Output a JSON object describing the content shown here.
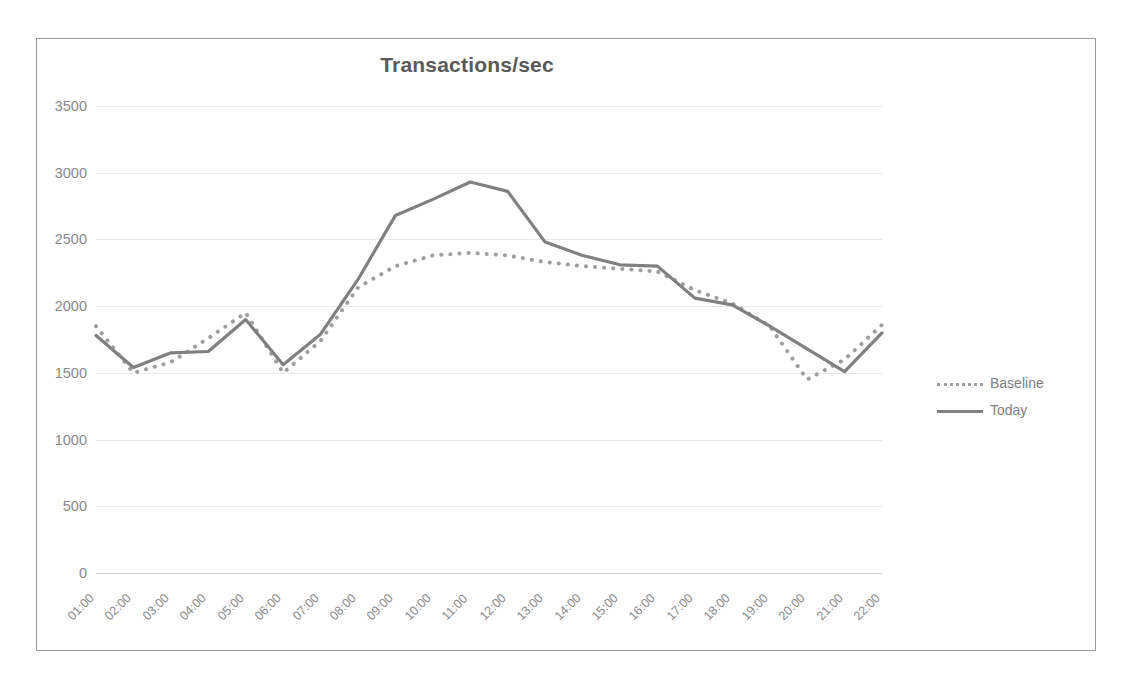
{
  "chart_data": {
    "type": "line",
    "title": "Transactions/sec",
    "xlabel": "",
    "ylabel": "",
    "ylim": [
      0,
      3500
    ],
    "yticks": [
      0,
      500,
      1000,
      1500,
      2000,
      2500,
      3000,
      3500
    ],
    "ytick_labels": [
      "0",
      "500",
      "1000",
      "1500",
      "2000",
      "2500",
      "3000",
      "3500"
    ],
    "grid": true,
    "legend_position": "right",
    "categories": [
      "01:00",
      "02:00",
      "03:00",
      "04:00",
      "05:00",
      "06:00",
      "07:00",
      "08:00",
      "09:00",
      "10:00",
      "11:00",
      "12:00",
      "13:00",
      "14:00",
      "15:00",
      "16:00",
      "17:00",
      "18:00",
      "19:00",
      "20:00",
      "21:00",
      "22:00"
    ],
    "series": [
      {
        "name": "Baseline",
        "style": "dotted",
        "color": "#9e9e9e",
        "values": [
          1850,
          1500,
          1580,
          1760,
          1950,
          1500,
          1740,
          2140,
          2300,
          2380,
          2400,
          2380,
          2330,
          2300,
          2280,
          2260,
          2120,
          2020,
          1850,
          1450,
          1600,
          1860
        ]
      },
      {
        "name": "Today",
        "style": "solid",
        "color": "#808080",
        "values": [
          1780,
          1540,
          1650,
          1660,
          1900,
          1560,
          1790,
          2200,
          2680,
          2800,
          2930,
          2860,
          2480,
          2380,
          2310,
          2300,
          2060,
          2010,
          1850,
          1680,
          1510,
          1800
        ]
      }
    ]
  },
  "legend": {
    "items": [
      {
        "label": "Baseline"
      },
      {
        "label": "Today"
      }
    ]
  },
  "colors": {
    "frame": "#9a9a9a",
    "grid": "#e8e8e8",
    "tick_text": "#8a8a8a",
    "title_text": "#595959"
  }
}
